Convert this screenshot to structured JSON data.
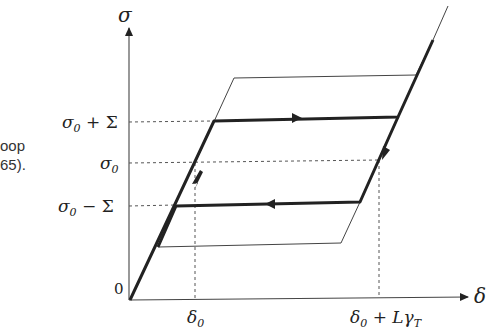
{
  "side_text": {
    "line1": "oop",
    "line2": "65)."
  },
  "axes": {
    "y_label": "σ",
    "x_label": "δ",
    "origin_label": "0"
  },
  "y_ticks": [
    {
      "label": "σ0 + Σ",
      "base": "σ",
      "sub": "0",
      "rest": " + Σ"
    },
    {
      "label": "σ0",
      "base": "σ",
      "sub": "0",
      "rest": ""
    },
    {
      "label": "σ0 − Σ",
      "base": "σ",
      "sub": "0",
      "rest": " − Σ"
    }
  ],
  "x_ticks": [
    {
      "label": "δ0",
      "base": "δ",
      "sub": "0",
      "rest": ""
    },
    {
      "label": "δ0 + LγT",
      "base": "δ",
      "sub": "0",
      "rest": " + Lγ",
      "sub2": "T"
    }
  ],
  "colors": {
    "thick": "#222222",
    "thin": "#444444",
    "dashed": "#555555"
  }
}
